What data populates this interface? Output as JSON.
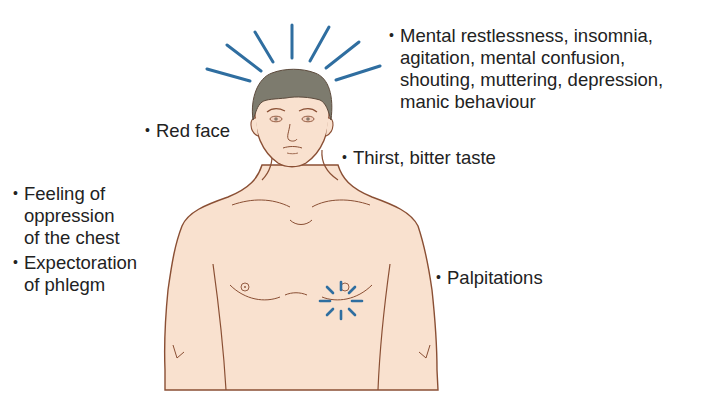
{
  "diagram": {
    "colors": {
      "skin": "#f9e1cf",
      "outline": "#8a4f34",
      "hair": "#7d7b6e",
      "rays": "#2f6ea0",
      "text": "#222222"
    },
    "icons": {
      "head_rays": "radiating-lines-icon",
      "heart_burst": "heart-burst-icon"
    }
  },
  "labels": {
    "mental": {
      "bullet": "•",
      "lines": [
        "Mental restlessness, insomnia,",
        "agitation, mental confusion,",
        "shouting, muttering, depression,",
        "manic behaviour"
      ]
    },
    "red_face": {
      "bullet": "•",
      "text": "Red face"
    },
    "thirst": {
      "bullet": "•",
      "text": "Thirst, bitter taste"
    },
    "chest": {
      "bullet": "•",
      "lines": [
        "Feeling of",
        "oppression",
        "of the chest"
      ]
    },
    "phlegm": {
      "bullet": "•",
      "lines": [
        "Expectoration",
        "of phlegm"
      ]
    },
    "palpitations": {
      "bullet": "•",
      "text": "Palpitations"
    }
  }
}
